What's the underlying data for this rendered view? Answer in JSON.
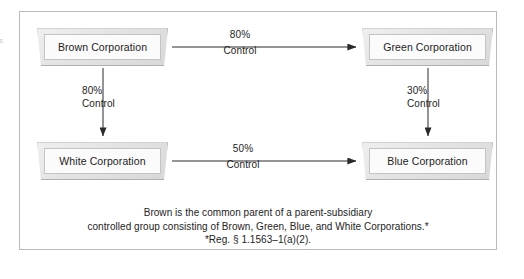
{
  "diagram": {
    "margin_artifact": "s",
    "boxes": [
      {
        "id": "brown",
        "label": "Brown Corporation"
      },
      {
        "id": "green",
        "label": "Green Corporation"
      },
      {
        "id": "white",
        "label": "White Corporation"
      },
      {
        "id": "blue",
        "label": "Blue Corporation"
      }
    ],
    "edges": [
      {
        "id": "brown-green",
        "from": "Brown Corporation",
        "to": "Green Corporation",
        "direction": "horizontal",
        "percent": "80%",
        "relation": "Control"
      },
      {
        "id": "brown-white",
        "from": "Brown Corporation",
        "to": "White Corporation",
        "direction": "vertical",
        "percent": "80%",
        "relation": "Control"
      },
      {
        "id": "green-blue",
        "from": "Green Corporation",
        "to": "Blue Corporation",
        "direction": "vertical",
        "percent": "30%",
        "relation": "Control"
      },
      {
        "id": "white-blue",
        "from": "White Corporation",
        "to": "Blue Corporation",
        "direction": "horizontal",
        "percent": "50%",
        "relation": "Control"
      }
    ],
    "caption": {
      "line1": "Brown is the common parent of a parent-subsidiary",
      "line2": "controlled group consisting of Brown, Green, Blue, and White Corporations.*",
      "line3": "*Reg. § 1.1563–1(a)(2)."
    }
  },
  "colors": {
    "frame_border": "#b9b9b9",
    "arrow_stroke": "#2b2b2b",
    "box_face": "#fbfbfb",
    "box_bevel": "#e4e4e4",
    "text": "#232323",
    "page_background": "#ffffff"
  }
}
